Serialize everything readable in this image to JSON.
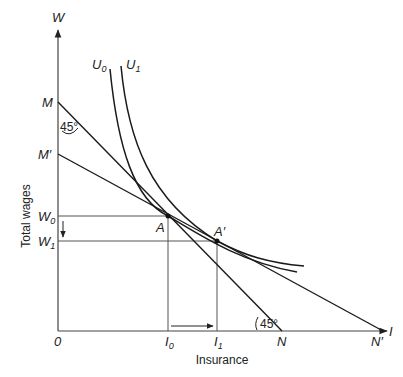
{
  "diagram": {
    "axes": {
      "y_symbol": "W",
      "x_symbol": "I",
      "origin": "0",
      "y_title": "Total wages",
      "x_title": "Insurance"
    },
    "curves": {
      "u0": {
        "label": "U",
        "sub": "0"
      },
      "u1": {
        "label": "U",
        "sub": "1"
      }
    },
    "budget_lines": {
      "m": "M",
      "m_prime": "M′",
      "n": "N",
      "n_prime": "N′"
    },
    "points": {
      "a": "A",
      "a_prime": "A′"
    },
    "levels": {
      "w0": {
        "label": "W",
        "sub": "0"
      },
      "w1": {
        "label": "W",
        "sub": "1"
      },
      "i0": {
        "label": "I",
        "sub": "0"
      },
      "i1": {
        "label": "I",
        "sub": "1"
      }
    },
    "angles": {
      "top": "45°",
      "bottom": "45°"
    },
    "colors": {
      "line": "#1a1a1a",
      "guide": "#555555"
    }
  }
}
